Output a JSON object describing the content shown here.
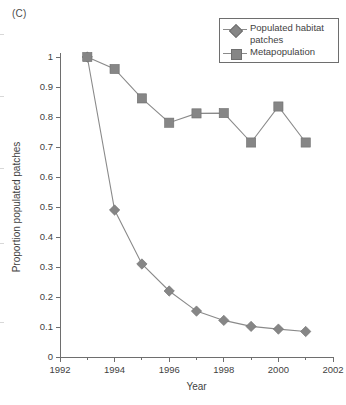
{
  "panel": {
    "label": "(C)"
  },
  "legend": {
    "position": "top-right",
    "entries": [
      {
        "label": "Populated habitat patches",
        "marker": "diamond-marker-icon",
        "color": "#868686"
      },
      {
        "label": "Metapopulation",
        "marker": "square-marker-icon",
        "color": "#868686"
      }
    ]
  },
  "chart_data": {
    "type": "line",
    "title": "",
    "xlabel": "Year",
    "ylabel": "Proportion populated patches",
    "xlim": [
      1992,
      2002
    ],
    "ylim": [
      0,
      1
    ],
    "grid": false,
    "x": [
      1993,
      1994,
      1995,
      1996,
      1997,
      1998,
      1999,
      2000,
      2001
    ],
    "xticks": [
      1992,
      1994,
      1996,
      1998,
      2000,
      2002
    ],
    "xticklabels": [
      "1992",
      "1994",
      "1996",
      "1998",
      "2000",
      "2002"
    ],
    "xminorticks": [
      1993,
      1995,
      1997,
      1999,
      2001
    ],
    "yticks": [
      0,
      0.1,
      0.2,
      0.3,
      0.4,
      0.5,
      0.6,
      0.7,
      0.8,
      0.9,
      1
    ],
    "yticklabels": [
      "0",
      "0.1",
      "0.2",
      "0.3",
      "0.4",
      "0.5",
      "0.6",
      "0.7",
      "0.8",
      "0.9",
      "1"
    ],
    "legend_position": "upper right",
    "series": [
      {
        "name": "Populated habitat patches",
        "marker": "diamond",
        "color": "#868686",
        "values": [
          1.0,
          0.49,
          0.31,
          0.22,
          0.153,
          0.122,
          0.102,
          0.093,
          0.085
        ]
      },
      {
        "name": "Metapopulation",
        "marker": "square",
        "color": "#868686",
        "values": [
          1.0,
          0.96,
          0.862,
          0.781,
          0.812,
          0.813,
          0.715,
          0.835,
          0.715
        ]
      }
    ]
  }
}
